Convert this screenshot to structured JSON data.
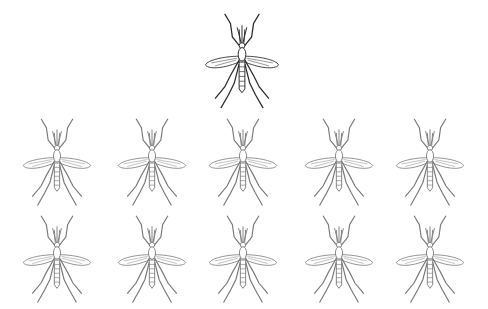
{
  "scene": {
    "description": "Illustration of mosquitoes: one dark mosquito on top, two rows of five light outlined mosquitoes below",
    "background": "#ffffff",
    "colors": {
      "dark_outline": "#2a2a2a",
      "light_outline": "#6e6e6e"
    }
  },
  "top": {
    "label": "dark-mosquito",
    "count": 1
  },
  "rows": [
    {
      "label": "row-1",
      "count": 5
    },
    {
      "label": "row-2",
      "count": 5
    }
  ]
}
